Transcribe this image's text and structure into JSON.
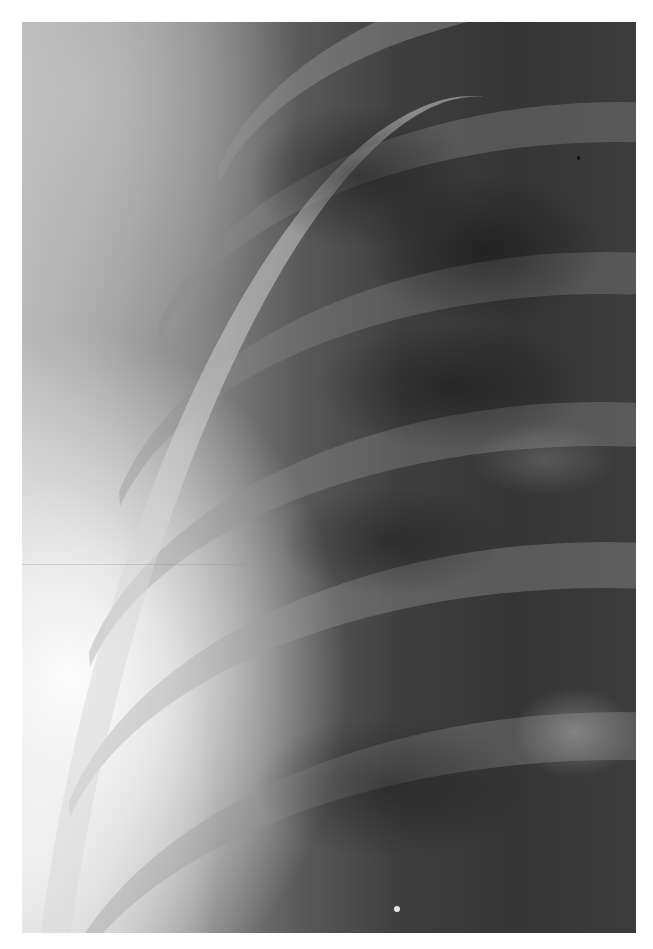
{
  "image": {
    "subject": "chest radiograph",
    "description": "Grayscale X-ray crop showing curved ribs over lung field, bright soft tissue along left edge",
    "colors": {
      "background": "#ffffff",
      "bright_region": "#f2f2f2",
      "lung_dark": "#353535",
      "rib_tone": "#969696"
    }
  }
}
